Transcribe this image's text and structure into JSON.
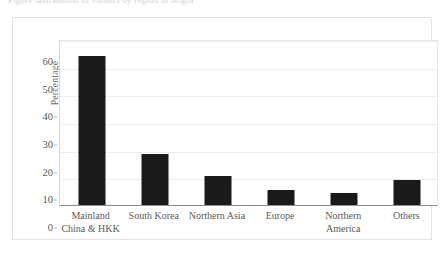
{
  "caption": {
    "text": "Figure distribution of visitors by region of origin"
  },
  "chart_data": {
    "type": "bar",
    "title": "",
    "subtitle": "",
    "xlabel": "",
    "ylabel": "Percentage",
    "ylim": [
      0,
      60
    ],
    "ytick_step": 10,
    "yticks": [
      60,
      50,
      40,
      30,
      20,
      10,
      0
    ],
    "grid": true,
    "legend": "none",
    "bar_color": "#1a1a1a",
    "categories": [
      "Mainland China & HKK",
      "South Korea",
      "Northern Asia",
      "Europe",
      "Northern America",
      "Others"
    ],
    "category_lines": [
      [
        "Mainland",
        "China & HKK"
      ],
      [
        "South Korea",
        ""
      ],
      [
        "Northern Asia",
        ""
      ],
      [
        "Europe",
        ""
      ],
      [
        "Northern",
        "America"
      ],
      [
        "Others",
        ""
      ]
    ],
    "values": [
      54,
      18.5,
      10.5,
      5.5,
      4.5,
      9
    ]
  }
}
